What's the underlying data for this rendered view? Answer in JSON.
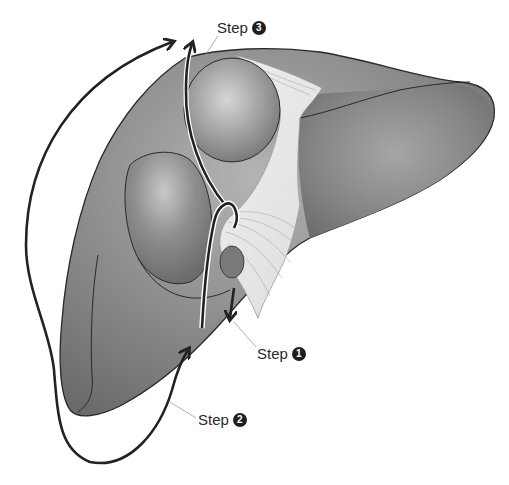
{
  "diagram": {
    "labels": [
      {
        "id": "step1",
        "text": "Step",
        "number": "1"
      },
      {
        "id": "step2",
        "text": "Step",
        "number": "2"
      },
      {
        "id": "step3",
        "text": "Step",
        "number": "3"
      }
    ],
    "colors": {
      "organ_dark": "#6e6e6e",
      "organ_mid": "#8e8e8e",
      "organ_light": "#c4c4c4",
      "ligament": "#e4e4e4",
      "arrow": "#222222",
      "leader_line": "#9a9a9a",
      "background": "#ffffff"
    }
  }
}
